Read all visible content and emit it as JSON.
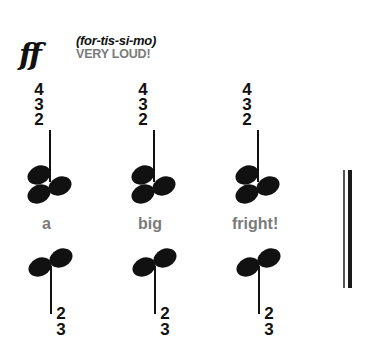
{
  "dynamic": {
    "symbol": "ff",
    "pronunciation": "(for-tis-si-mo)",
    "meaning": "VERY LOUD!"
  },
  "chords": [
    {
      "upper_fingering": [
        "4",
        "3",
        "2"
      ],
      "lyric": "a",
      "lower_fingering": [
        "2",
        "3"
      ]
    },
    {
      "upper_fingering": [
        "4",
        "3",
        "2"
      ],
      "lyric": "big",
      "lower_fingering": [
        "2",
        "3"
      ]
    },
    {
      "upper_fingering": [
        "4",
        "3",
        "2"
      ],
      "lyric": "fright!",
      "lower_fingering": [
        "2",
        "3"
      ]
    }
  ],
  "barline": "final-double-bar",
  "colors": {
    "notation": "#111111",
    "text_gray": "#7a7a7a",
    "background": "#ffffff"
  }
}
